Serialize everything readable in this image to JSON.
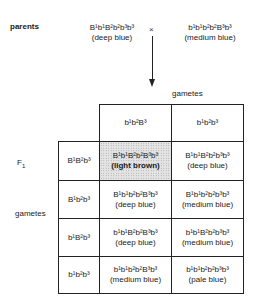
{
  "parents": {
    "label": "parents",
    "cross_symbol": "×",
    "parent1": {
      "genotype": "B¹b¹B²b²b³b³",
      "phenotype": "(deep blue)"
    },
    "parent2": {
      "genotype": "b¹b¹b²b²B³b³",
      "phenotype": "(medium blue)"
    }
  },
  "labels": {
    "gametes_top": "gametes",
    "gametes_side": "gametes",
    "f1": "F₁"
  },
  "column_gametes": [
    "b¹b²B³",
    "b¹b²b³"
  ],
  "row_gametes": [
    "B¹B²b³",
    "B¹b²b³",
    "b¹B²b³",
    "b¹b²b³"
  ],
  "offspring": [
    [
      {
        "genotype": "B¹b¹B²b²B³b³",
        "phenotype": "(light brown)",
        "highlighted": true
      },
      {
        "genotype": "B¹b¹B²b²b³b³",
        "phenotype": "(deep blue)",
        "highlighted": false
      }
    ],
    [
      {
        "genotype": "B¹b¹b²b²B³b³",
        "phenotype": "(deep blue)",
        "highlighted": false
      },
      {
        "genotype": "B¹b¹b²b²b³b³",
        "phenotype": "(medium blue)",
        "highlighted": false
      }
    ],
    [
      {
        "genotype": "b¹b¹B²b²B³b³",
        "phenotype": "(deep blue)",
        "highlighted": false
      },
      {
        "genotype": "b¹b¹B²b²b³b³",
        "phenotype": "(medium blue)",
        "highlighted": false
      }
    ],
    [
      {
        "genotype": "b¹b¹b²b²B³b³",
        "phenotype": "(medium blue)",
        "highlighted": false
      },
      {
        "genotype": "b¹b¹b²b²b³b³",
        "phenotype": "(pale blue)",
        "highlighted": false
      }
    ]
  ]
}
